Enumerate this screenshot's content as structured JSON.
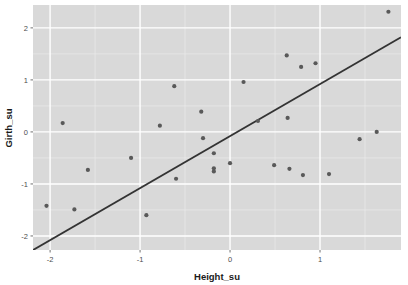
{
  "chart_data": {
    "type": "scatter",
    "title": "",
    "xlabel": "Height_su",
    "ylabel": "Girth_su",
    "xlim": [
      -2.19,
      1.9
    ],
    "ylim": [
      -2.27,
      2.44
    ],
    "xticks": [
      -2,
      -1,
      0,
      1
    ],
    "xticklabels": [
      "-2",
      "-1",
      "0",
      "1"
    ],
    "yticks": [
      -2,
      -1,
      0,
      1,
      2
    ],
    "yticklabels": [
      "-2",
      "-1",
      "0",
      "1",
      "2"
    ],
    "grid": true,
    "legend": "none",
    "panel_background": "#d9d9d9",
    "major_gridline_color": "#ffffff",
    "minor_gridline_color": "#ebebeb",
    "point_color": "#595959",
    "point_size": 2.1,
    "points": [
      {
        "x": -2.04,
        "y": -1.42
      },
      {
        "x": -1.86,
        "y": 0.17
      },
      {
        "x": -1.73,
        "y": -1.49
      },
      {
        "x": -1.58,
        "y": -0.73
      },
      {
        "x": -1.1,
        "y": -0.5
      },
      {
        "x": -0.93,
        "y": -1.6
      },
      {
        "x": -0.78,
        "y": 0.12
      },
      {
        "x": -0.62,
        "y": 0.88
      },
      {
        "x": -0.6,
        "y": -0.9
      },
      {
        "x": -0.32,
        "y": 0.39
      },
      {
        "x": -0.3,
        "y": -0.12
      },
      {
        "x": -0.18,
        "y": -0.41
      },
      {
        "x": -0.18,
        "y": -0.7
      },
      {
        "x": -0.18,
        "y": -0.76
      },
      {
        "x": 0.0,
        "y": -0.6
      },
      {
        "x": 0.15,
        "y": 0.96
      },
      {
        "x": 0.31,
        "y": 0.21
      },
      {
        "x": 0.49,
        "y": -0.64
      },
      {
        "x": 0.63,
        "y": 1.47
      },
      {
        "x": 0.64,
        "y": 0.27
      },
      {
        "x": 0.66,
        "y": -0.71
      },
      {
        "x": 0.79,
        "y": 1.25
      },
      {
        "x": 0.81,
        "y": -0.83
      },
      {
        "x": 0.95,
        "y": 1.32
      },
      {
        "x": 1.1,
        "y": -0.81
      },
      {
        "x": 1.44,
        "y": -0.14
      },
      {
        "x": 1.63,
        "y": 0.0
      },
      {
        "x": 1.76,
        "y": 2.31
      }
    ],
    "trend_line": {
      "type": "straight",
      "color": "#333333",
      "width": 1.9,
      "x_start": -2.19,
      "y_start": -2.27,
      "x_end": 1.9,
      "y_end": 1.82
    }
  }
}
